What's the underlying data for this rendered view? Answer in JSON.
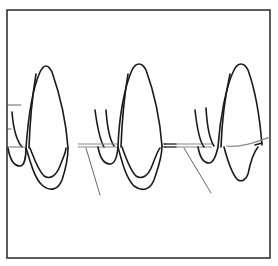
{
  "figure": {
    "panels": [
      {
        "id": "panel-1",
        "label": ""
      },
      {
        "id": "panel-2",
        "label": ""
      },
      {
        "id": "panel-3",
        "label": ""
      }
    ],
    "colors": {
      "ink": "#1a1a1a",
      "frame": "#333333",
      "leader_line": "#555555",
      "reference_line": "#888888",
      "background": "#ffffff"
    }
  }
}
